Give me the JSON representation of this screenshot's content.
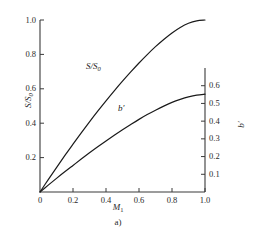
{
  "chart_data": {
    "type": "line",
    "title": "",
    "caption": "a)",
    "xlabel": "M",
    "xlabel_sub": "1",
    "ylabel_left": "S/S",
    "ylabel_left_sub": "0",
    "ylabel_right": "b′",
    "grid": false,
    "legend": "inline-curve-labels",
    "xlim": [
      0,
      1.0
    ],
    "xticks": [
      "0",
      "0.2",
      "0.4",
      "0.6",
      "0.8",
      "1.0"
    ],
    "xtick_values": [
      0,
      0.2,
      0.4,
      0.6,
      0.8,
      1.0
    ],
    "left_axis": {
      "label": "S/S0",
      "lim": [
        0,
        1.0
      ],
      "ticks": [
        "0.2",
        "0.4",
        "0.6",
        "0.8",
        "1.0"
      ],
      "tick_values": [
        0.2,
        0.4,
        0.6,
        0.8,
        1.0
      ]
    },
    "right_axis": {
      "label": "b′",
      "lim": [
        0,
        0.7
      ],
      "ticks": [
        "0.1",
        "0.2",
        "0.3",
        "0.4",
        "0.5",
        "0.6"
      ],
      "tick_values": [
        0.1,
        0.2,
        0.3,
        0.4,
        0.5,
        0.6
      ]
    },
    "series": [
      {
        "name": "S/S0",
        "label": "S/S",
        "label_sub": "0",
        "axis": "left",
        "color": "#1a1a1a",
        "x": [
          0,
          0.05,
          0.1,
          0.15,
          0.2,
          0.25,
          0.3,
          0.35,
          0.4,
          0.45,
          0.5,
          0.55,
          0.6,
          0.65,
          0.7,
          0.75,
          0.8,
          0.85,
          0.9,
          0.95,
          1.0
        ],
        "values": [
          0,
          0.072,
          0.142,
          0.211,
          0.278,
          0.344,
          0.408,
          0.47,
          0.53,
          0.588,
          0.644,
          0.698,
          0.75,
          0.799,
          0.845,
          0.887,
          0.925,
          0.957,
          0.981,
          0.995,
          1.0
        ]
      },
      {
        "name": "b'",
        "label": "b′",
        "axis": "right",
        "color": "#1a1a1a",
        "x": [
          0,
          0.05,
          0.1,
          0.15,
          0.2,
          0.25,
          0.3,
          0.35,
          0.4,
          0.45,
          0.5,
          0.55,
          0.6,
          0.65,
          0.7,
          0.75,
          0.8,
          0.85,
          0.9,
          0.95,
          1.0
        ],
        "values": [
          0,
          0.039,
          0.077,
          0.114,
          0.15,
          0.186,
          0.221,
          0.255,
          0.288,
          0.32,
          0.351,
          0.381,
          0.41,
          0.437,
          0.462,
          0.485,
          0.506,
          0.523,
          0.537,
          0.547,
          0.552
        ]
      }
    ],
    "curve_label_positions": [
      {
        "name": "S/S0",
        "x_px": 86,
        "y_px": 62
      },
      {
        "name": "b'",
        "x_px": 118,
        "y_px": 104
      }
    ]
  }
}
